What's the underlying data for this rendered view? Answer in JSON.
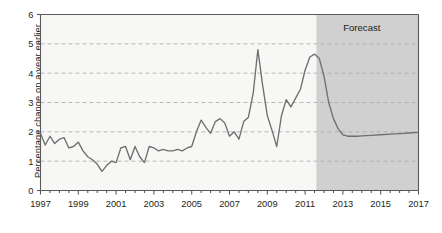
{
  "chart_data": {
    "type": "line",
    "title": "",
    "xlabel": "",
    "ylabel": "Percentage change on a year earlier",
    "xlim": [
      1997,
      2017
    ],
    "ylim": [
      0,
      6
    ],
    "yticks": [
      0,
      1,
      2,
      3,
      4,
      5,
      6
    ],
    "xticks": [
      1997,
      1999,
      2001,
      2003,
      2005,
      2007,
      2009,
      2011,
      2013,
      2015,
      2017
    ],
    "xticklabels": [
      "1997",
      "1999",
      "2001",
      "2003",
      "2005",
      "2007",
      "2009",
      "2011",
      "2013",
      "2015",
      "2017"
    ],
    "yticklabels": [
      "0",
      "1",
      "2",
      "3",
      "4",
      "5",
      "6"
    ],
    "minor_xticks_every": 0.5,
    "grid": "horizontal-dashed",
    "legend": "none",
    "annotations": [
      {
        "text": "Forecast",
        "x": 2014.0,
        "y": 5.45,
        "region_start": 2011.6,
        "region_end": 2017.0
      }
    ],
    "series": [
      {
        "name": "Percentage change on a year earlier",
        "color": "#6f6f6f",
        "x": [
          1997.0,
          1997.25,
          1997.5,
          1997.75,
          1998.0,
          1998.25,
          1998.5,
          1998.75,
          1999.0,
          1999.25,
          1999.5,
          1999.75,
          2000.0,
          2000.25,
          2000.5,
          2000.75,
          2001.0,
          2001.25,
          2001.5,
          2001.75,
          2002.0,
          2002.25,
          2002.5,
          2002.75,
          2003.0,
          2003.25,
          2003.5,
          2003.75,
          2004.0,
          2004.25,
          2004.5,
          2004.75,
          2005.0,
          2005.25,
          2005.5,
          2005.75,
          2006.0,
          2006.25,
          2006.5,
          2006.75,
          2007.0,
          2007.25,
          2007.5,
          2007.75,
          2008.0,
          2008.25,
          2008.5,
          2008.75,
          2009.0,
          2009.25,
          2009.5,
          2009.75,
          2010.0,
          2010.25,
          2010.5,
          2010.75,
          2011.0,
          2011.25,
          2011.5,
          2011.75,
          2012.0,
          2012.25,
          2012.5,
          2012.75,
          2013.0,
          2013.25,
          2013.5,
          2013.75,
          2014.0,
          2014.5,
          2015.0,
          2015.5,
          2016.0,
          2016.5,
          2017.0
        ],
        "y": [
          1.95,
          1.55,
          1.85,
          1.6,
          1.75,
          1.8,
          1.45,
          1.5,
          1.65,
          1.35,
          1.15,
          1.05,
          0.9,
          0.65,
          0.85,
          1.0,
          0.95,
          1.45,
          1.5,
          1.05,
          1.5,
          1.15,
          0.95,
          1.5,
          1.45,
          1.35,
          1.4,
          1.35,
          1.35,
          1.4,
          1.35,
          1.45,
          1.5,
          2.0,
          2.4,
          2.15,
          1.95,
          2.35,
          2.45,
          2.3,
          1.85,
          2.0,
          1.75,
          2.35,
          2.5,
          3.3,
          4.8,
          3.6,
          2.55,
          2.05,
          1.5,
          2.55,
          3.1,
          2.85,
          3.15,
          3.45,
          4.1,
          4.55,
          4.65,
          4.5,
          3.9,
          3.0,
          2.45,
          2.1,
          1.9,
          1.85,
          1.85,
          1.85,
          1.86,
          1.88,
          1.9,
          1.92,
          1.94,
          1.96,
          1.98
        ]
      }
    ]
  },
  "axis": {
    "ylabel": "Percentage change on a year earlier"
  },
  "forecast": {
    "label": "Forecast"
  },
  "colors": {
    "line": "#6f6f6f",
    "forecast_shade": "#cccccc",
    "plot_bg": "#f7f7f5",
    "grid": "#a8a8a8",
    "frame": "#595959"
  }
}
